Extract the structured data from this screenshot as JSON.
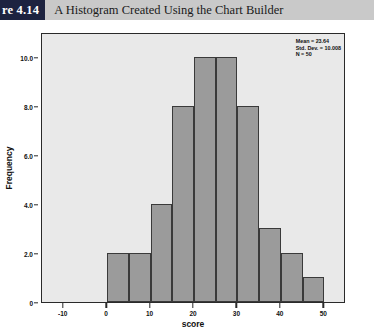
{
  "header": {
    "tab_label": "re 4.14",
    "caption": "A Histogram Created Using the Chart Builder"
  },
  "stats": {
    "mean_line": "Mean = 23.64",
    "stddev_line": "Std. Dev. = 10.008",
    "n_line": "N = 50"
  },
  "chart_data": {
    "type": "bar",
    "title": "A Histogram Created Using the Chart Builder",
    "xlabel": "score",
    "ylabel": "Frequency",
    "xlim": [
      -15,
      55
    ],
    "ylim": [
      0,
      11
    ],
    "grid": false,
    "legend": null,
    "bin_width": 5,
    "bin_starts": [
      0,
      5,
      10,
      15,
      20,
      25,
      30,
      35,
      40,
      45
    ],
    "bin_ends": [
      5,
      10,
      15,
      20,
      25,
      30,
      35,
      40,
      45,
      50
    ],
    "categories": [
      "0-5",
      "5-10",
      "10-15",
      "15-20",
      "20-25",
      "25-30",
      "30-35",
      "35-40",
      "40-45",
      "45-50"
    ],
    "values": [
      2,
      2,
      4,
      8,
      10,
      10,
      8,
      3,
      2,
      1
    ],
    "xticks": [
      -10,
      0,
      10,
      20,
      30,
      40,
      50
    ],
    "xtick_labels": [
      "-10",
      "0",
      "10",
      "20",
      "30",
      "40",
      "50"
    ],
    "yticks": [
      0,
      2,
      4,
      6,
      8,
      10
    ],
    "ytick_labels": [
      "0",
      "2.0",
      "4.0",
      "6.0",
      "8.0",
      "10.0"
    ],
    "annotations": [
      "Mean = 23.64",
      "Std. Dev. = 10.008",
      "N = 50"
    ],
    "bar_color": "#9b9b9b",
    "bar_edge_color": "#3a3a3a",
    "plot_background": "#e9e9e9"
  }
}
